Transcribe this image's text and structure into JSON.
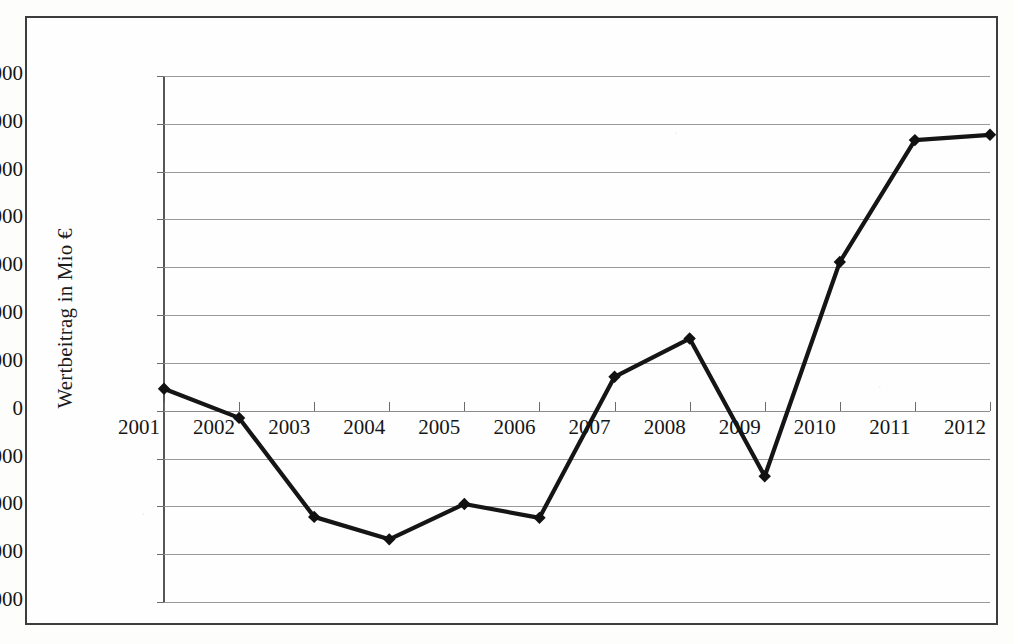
{
  "chart_data": {
    "type": "line",
    "title": "",
    "xlabel": "",
    "ylabel": "Wertbeitrag in Mio €",
    "categories": [
      "2001",
      "2002",
      "2003",
      "2004",
      "2005",
      "2006",
      "2007",
      "2008",
      "2009",
      "2010",
      "2011",
      "2012"
    ],
    "values": [
      460,
      -150,
      -2220,
      -2690,
      -1950,
      -2240,
      710,
      1510,
      -1370,
      3110,
      5660,
      5770
    ],
    "series": [
      {
        "name": "Wertbeitrag",
        "values": [
          460,
          -150,
          -2220,
          -2690,
          -1950,
          -2240,
          710,
          1510,
          -1370,
          3110,
          5660,
          5770
        ]
      }
    ],
    "ylim": [
      -4000,
      7000
    ],
    "y_ticks": [
      7000,
      6000,
      5000,
      4000,
      3000,
      2000,
      1000,
      0,
      -1000,
      -2000,
      -3000,
      -4000
    ],
    "y_tick_labels": [
      "7.000",
      "6.000",
      "5.000",
      "4.000",
      "3.000",
      "2.000",
      "1.000",
      "0",
      "-1.000",
      "-2.000",
      "-3.000",
      "-4.000"
    ],
    "grid": true,
    "grid_orientation": "horizontal",
    "legend": false,
    "legend_position": "none",
    "marker": "diamond",
    "line_color": "#151515",
    "marker_color": "#111111",
    "grid_color": "#9a9a9a",
    "background_color": "#fefefe",
    "border_color": "#3d3d3d"
  }
}
